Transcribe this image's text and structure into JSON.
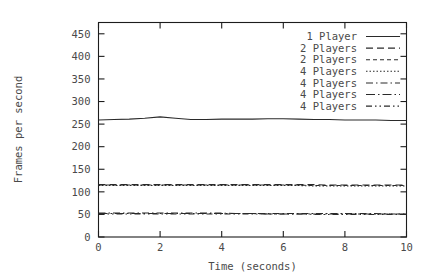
{
  "chart_data": {
    "type": "line",
    "title": "",
    "subtitle": "",
    "xlabel": "Time (seconds)",
    "ylabel": "Frames per second",
    "xlim": [
      0,
      10
    ],
    "ylim": [
      0,
      475
    ],
    "xticks": [
      0,
      2,
      4,
      6,
      8,
      10
    ],
    "yticks": [
      0,
      50,
      100,
      150,
      200,
      250,
      300,
      350,
      400,
      450
    ],
    "xtick_labels": [
      "0",
      "2",
      "4",
      "6",
      "8",
      "10"
    ],
    "ytick_labels": [
      "0",
      "50",
      "100",
      "150",
      "200",
      "250",
      "300",
      "350",
      "400",
      "450"
    ],
    "grid": false,
    "legend_position": "top-right",
    "x": [
      0,
      0.5,
      1,
      1.5,
      2,
      2.5,
      3,
      3.5,
      4,
      4.5,
      5,
      5.5,
      6,
      6.5,
      7,
      7.5,
      8,
      8.5,
      9,
      9.5,
      10
    ],
    "series": [
      {
        "name": "1 Player",
        "dash": "solid",
        "values": [
          259,
          260,
          261,
          263,
          266,
          263,
          260,
          260,
          261,
          261,
          261,
          262,
          262,
          261,
          260,
          260,
          259,
          259,
          259,
          258,
          258
        ]
      },
      {
        "name": "2 Players",
        "dash": "dashed",
        "values": [
          116,
          116,
          116,
          116,
          116,
          116,
          116,
          116,
          116,
          116,
          116,
          116,
          116,
          116,
          116,
          115,
          115,
          115,
          115,
          115,
          115
        ]
      },
      {
        "name": "2 Players",
        "dash": "short-dash",
        "values": [
          115,
          115,
          115,
          115,
          115,
          115,
          115,
          115,
          115,
          115,
          115,
          115,
          115,
          115,
          114,
          114,
          114,
          114,
          114,
          114,
          114
        ]
      },
      {
        "name": "4 Players",
        "dash": "dotted",
        "values": [
          114,
          114,
          114,
          114,
          114,
          114,
          114,
          114,
          114,
          114,
          114,
          114,
          114,
          114,
          113,
          113,
          113,
          113,
          113,
          113,
          113
        ]
      },
      {
        "name": "4 Players",
        "dash": "dash-dot",
        "values": [
          53,
          53,
          53,
          53,
          53,
          53,
          53,
          53,
          53,
          52,
          52,
          52,
          52,
          52,
          52,
          52,
          52,
          52,
          52,
          51,
          51
        ]
      },
      {
        "name": "4 Players",
        "dash": "dash-dot-wide",
        "values": [
          52,
          52,
          52,
          52,
          52,
          52,
          52,
          52,
          52,
          52,
          52,
          51,
          51,
          51,
          51,
          51,
          51,
          51,
          51,
          51,
          51
        ]
      },
      {
        "name": "4 Players",
        "dash": "dash-dot-dot",
        "values": [
          51,
          51,
          51,
          51,
          51,
          51,
          51,
          51,
          51,
          51,
          51,
          51,
          51,
          51,
          50,
          50,
          50,
          50,
          50,
          50,
          50
        ]
      }
    ]
  },
  "legend": {
    "entries": [
      {
        "label": "1 Player"
      },
      {
        "label": "2 Players"
      },
      {
        "label": "2 Players"
      },
      {
        "label": "4 Players"
      },
      {
        "label": "4 Players"
      },
      {
        "label": "4 Players"
      },
      {
        "label": "4 Players"
      }
    ]
  },
  "colors": {
    "background": "#ffffff",
    "axis": "#1c1c1c",
    "line": "#2a2a2a",
    "text": "#4a4a4a"
  }
}
